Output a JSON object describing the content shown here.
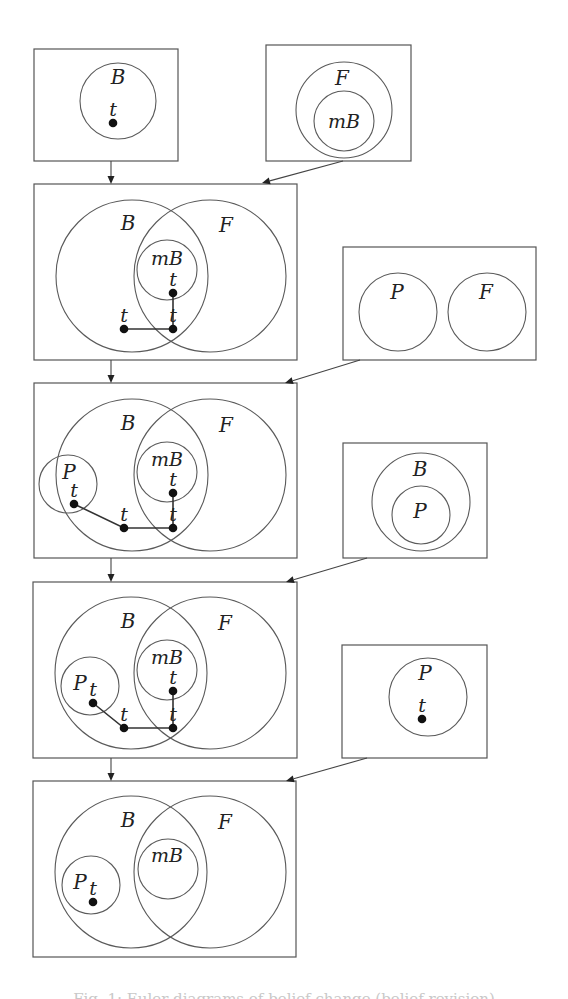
{
  "diagram": {
    "panels": [
      {
        "id": "panel-b-initial",
        "rect": [
          34,
          49,
          144,
          112
        ],
        "circles": [
          {
            "label": "B",
            "cx": 118,
            "cy": 101,
            "r": 38,
            "lx": 118,
            "ly": 84
          }
        ],
        "dots": [
          {
            "label": "t",
            "x": 113,
            "y": 123
          }
        ],
        "paths": []
      },
      {
        "id": "panel-f-mb",
        "rect": [
          266,
          45,
          145,
          116
        ],
        "circles": [
          {
            "label": "F",
            "cx": 344,
            "cy": 110,
            "r": 48,
            "lx": 342,
            "ly": 85
          },
          {
            "label": "mB",
            "cx": 344,
            "cy": 121,
            "r": 30,
            "lx": 344,
            "ly": 128
          }
        ],
        "dots": [],
        "paths": []
      },
      {
        "id": "panel-merge-1",
        "rect": [
          34,
          184,
          263,
          176
        ],
        "circles": [
          {
            "label": "B",
            "cx": 132,
            "cy": 276,
            "r": 76,
            "lx": 128,
            "ly": 230
          },
          {
            "label": "F",
            "cx": 210,
            "cy": 276,
            "r": 76,
            "lx": 226,
            "ly": 232
          },
          {
            "label": "mB",
            "cx": 167,
            "cy": 270,
            "r": 30,
            "lx": 167,
            "ly": 265
          }
        ],
        "dots": [
          {
            "label": "t",
            "x": 173,
            "y": 293
          },
          {
            "label": "t",
            "x": 124,
            "y": 329
          },
          {
            "label": "t",
            "x": 173,
            "y": 329
          }
        ],
        "paths": [
          [
            [
              173,
              293
            ],
            [
              173,
              329
            ],
            [
              124,
              329
            ]
          ]
        ]
      },
      {
        "id": "panel-p-f",
        "rect": [
          343,
          247,
          193,
          113
        ],
        "circles": [
          {
            "label": "P",
            "cx": 398,
            "cy": 312,
            "r": 39,
            "lx": 397,
            "ly": 299
          },
          {
            "label": "F",
            "cx": 487,
            "cy": 312,
            "r": 39,
            "lx": 486,
            "ly": 299
          }
        ],
        "dots": [],
        "paths": []
      },
      {
        "id": "panel-merge-2",
        "rect": [
          34,
          383,
          263,
          175
        ],
        "circles": [
          {
            "label": "B",
            "cx": 132,
            "cy": 475,
            "r": 76,
            "lx": 128,
            "ly": 430
          },
          {
            "label": "F",
            "cx": 210,
            "cy": 475,
            "r": 76,
            "lx": 226,
            "ly": 432
          },
          {
            "label": "mB",
            "cx": 167,
            "cy": 472,
            "r": 30,
            "lx": 167,
            "ly": 466
          },
          {
            "label": "P",
            "cx": 68,
            "cy": 484,
            "r": 29,
            "lx": 69,
            "ly": 479
          }
        ],
        "dots": [
          {
            "label": "t",
            "x": 74,
            "y": 504
          },
          {
            "label": "t",
            "x": 124,
            "y": 528
          },
          {
            "label": "t",
            "x": 173,
            "y": 528
          },
          {
            "label": "t",
            "x": 173,
            "y": 493
          }
        ],
        "paths": [
          [
            [
              74,
              504
            ],
            [
              124,
              528
            ],
            [
              173,
              528
            ],
            [
              173,
              493
            ]
          ]
        ]
      },
      {
        "id": "panel-b-p",
        "rect": [
          343,
          443,
          144,
          115
        ],
        "circles": [
          {
            "label": "B",
            "cx": 421,
            "cy": 502,
            "r": 49,
            "lx": 420,
            "ly": 476
          },
          {
            "label": "P",
            "cx": 421,
            "cy": 515,
            "r": 29,
            "lx": 420,
            "ly": 518
          }
        ],
        "dots": [],
        "paths": []
      },
      {
        "id": "panel-merge-3",
        "rect": [
          33,
          582,
          264,
          176
        ],
        "circles": [
          {
            "label": "B",
            "cx": 131,
            "cy": 673,
            "r": 76,
            "lx": 128,
            "ly": 628
          },
          {
            "label": "F",
            "cx": 210,
            "cy": 673,
            "r": 76,
            "lx": 225,
            "ly": 630
          },
          {
            "label": "mB",
            "cx": 167,
            "cy": 670,
            "r": 30,
            "lx": 167,
            "ly": 664
          },
          {
            "label": "P",
            "cx": 90,
            "cy": 686,
            "r": 29,
            "lx": 80,
            "ly": 690
          }
        ],
        "dots": [
          {
            "label": "t",
            "x": 93,
            "y": 703
          },
          {
            "label": "t",
            "x": 124,
            "y": 728
          },
          {
            "label": "t",
            "x": 173,
            "y": 728
          },
          {
            "label": "t",
            "x": 173,
            "y": 691
          }
        ],
        "paths": [
          [
            [
              93,
              703
            ],
            [
              124,
              728
            ],
            [
              173,
              728
            ],
            [
              173,
              691
            ]
          ]
        ]
      },
      {
        "id": "panel-p-t",
        "rect": [
          342,
          645,
          145,
          113
        ],
        "circles": [
          {
            "label": "P",
            "cx": 428,
            "cy": 697,
            "r": 39,
            "lx": 425,
            "ly": 680
          }
        ],
        "dots": [
          {
            "label": "t",
            "x": 422,
            "y": 719
          }
        ],
        "paths": []
      },
      {
        "id": "panel-final",
        "rect": [
          33,
          781,
          263,
          176
        ],
        "circles": [
          {
            "label": "B",
            "cx": 131,
            "cy": 872,
            "r": 76,
            "lx": 128,
            "ly": 827
          },
          {
            "label": "F",
            "cx": 210,
            "cy": 872,
            "r": 76,
            "lx": 225,
            "ly": 829
          },
          {
            "label": "mB",
            "cx": 168,
            "cy": 869,
            "r": 30,
            "lx": 167,
            "ly": 862
          },
          {
            "label": "P",
            "cx": 91,
            "cy": 885,
            "r": 29,
            "lx": 80,
            "ly": 889
          }
        ],
        "dots": [
          {
            "label": "t",
            "x": 93,
            "y": 902
          }
        ],
        "paths": []
      }
    ],
    "arrows": [
      {
        "from": [
          111,
          161
        ],
        "to": [
          111,
          184
        ]
      },
      {
        "from": [
          343,
          161
        ],
        "to": [
          262,
          183
        ]
      },
      {
        "from": [
          111,
          360
        ],
        "to": [
          111,
          383
        ]
      },
      {
        "from": [
          360,
          360
        ],
        "to": [
          285,
          383
        ]
      },
      {
        "from": [
          111,
          558
        ],
        "to": [
          111,
          582
        ]
      },
      {
        "from": [
          367,
          558
        ],
        "to": [
          286,
          582
        ]
      },
      {
        "from": [
          111,
          758
        ],
        "to": [
          111,
          781
        ]
      },
      {
        "from": [
          367,
          758
        ],
        "to": [
          286,
          781
        ]
      }
    ]
  },
  "caption": "Fig. 1: Euler diagrams of belief change (belief revision)"
}
